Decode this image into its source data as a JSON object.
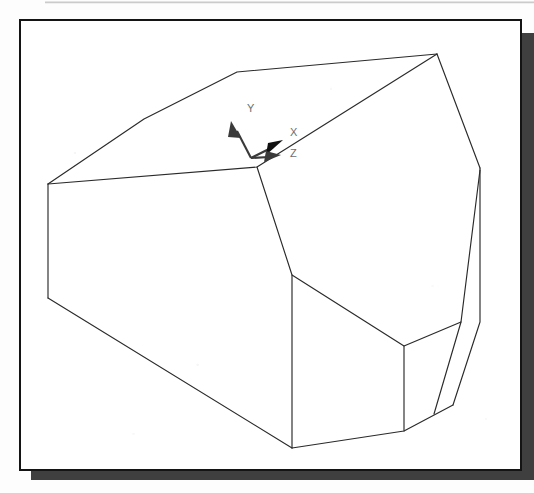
{
  "page": {
    "background_color": "#fdfdfd",
    "top_rule_color": "#8c8c8c"
  },
  "viewport": {
    "title": "3D Solid Model Viewport",
    "frame_border_color": "#141414",
    "frame_fill_color": "#ffffff",
    "shadow_color": "#3f3f3f",
    "edge_color": "#2a2a2a"
  },
  "axis_indicator": {
    "name": "ucs-axis-tripod",
    "origin": {
      "x": 230,
      "y": 136
    },
    "arrow_color": "#3a3a3a",
    "label_color": "#6e6e6e",
    "axes": [
      {
        "id": "y-axis",
        "label": "Y",
        "label_x": 226,
        "label_y": 88,
        "tip_x": 212,
        "tip_y": 106,
        "base_x": 230,
        "base_y": 136,
        "direction": "up-left"
      },
      {
        "id": "x-axis",
        "label": "X",
        "label_x": 269,
        "label_y": 112,
        "tip_x": 258,
        "tip_y": 122,
        "base_x": 230,
        "base_y": 136,
        "direction": "up-right"
      },
      {
        "id": "z-axis",
        "label": "Z",
        "label_x": 269,
        "label_y": 133,
        "tip_x": 262,
        "tip_y": 133,
        "base_x": 230,
        "base_y": 136,
        "direction": "right"
      }
    ]
  },
  "model": {
    "name": "beveled-prism-solid",
    "description": "Shaded 3D wireframe of a chamfered polyhedral block",
    "edges": [
      {
        "id": "top-face-outline",
        "points": "27,163 123,98 216,51 416,33 236,146 27,163"
      },
      {
        "id": "upper-right-ridge",
        "points": "416,33 236,146"
      },
      {
        "id": "right-upper-edge",
        "points": "416,33 459,146"
      },
      {
        "id": "right-lower-edge",
        "points": "459,146 459,300 432,383 414,392"
      },
      {
        "id": "right-inner-edge",
        "points": "459,148 441,300 414,392"
      },
      {
        "id": "left-vertical-edge",
        "points": "27,163 27,277"
      },
      {
        "id": "left-bottom-edge",
        "points": "27,277 271,427"
      },
      {
        "id": "bottom-edge",
        "points": "271,427 383,410 432,383"
      },
      {
        "id": "front-crease",
        "points": "236,146 271,254 271,427"
      },
      {
        "id": "lower-bevel-left",
        "points": "271,254 383,325 383,410"
      },
      {
        "id": "lower-bevel-right",
        "points": "383,325 441,300"
      }
    ]
  }
}
